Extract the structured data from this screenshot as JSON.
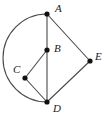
{
  "figure": {
    "kind": "geometry-diagram",
    "width": 107,
    "height": 116,
    "background_color": "#ffffff",
    "stroke_color": "#4a4a4a",
    "point_color": "#111111",
    "label_color": "#1a1a1a",
    "points": [
      {
        "id": "A",
        "label": "A",
        "x": 47,
        "y": 14,
        "label_x": 55,
        "label_y": 3
      },
      {
        "id": "B",
        "label": "B",
        "x": 47,
        "y": 50,
        "label_x": 54,
        "label_y": 43
      },
      {
        "id": "C",
        "label": "C",
        "x": 25,
        "y": 78,
        "label_x": 13,
        "label_y": 64
      },
      {
        "id": "D",
        "label": "D",
        "x": 47,
        "y": 102,
        "label_x": 53,
        "label_y": 103
      },
      {
        "id": "E",
        "label": "E",
        "x": 90,
        "y": 61,
        "label_x": 95,
        "label_y": 51
      }
    ],
    "segments": [
      {
        "id": "A-E",
        "from": "A",
        "to": "E"
      },
      {
        "id": "E-D",
        "from": "E",
        "to": "D"
      },
      {
        "id": "A-D",
        "from": "A",
        "to": "D"
      },
      {
        "id": "B-C",
        "from": "B",
        "to": "C"
      },
      {
        "id": "C-D",
        "from": "C",
        "to": "D"
      }
    ],
    "arc": {
      "id": "arc-A-D",
      "from": "A",
      "to": "D",
      "sweep": "counterclockwise-left",
      "radius": 44,
      "leftmost_x": 4,
      "leftmost_y": 58
    }
  }
}
